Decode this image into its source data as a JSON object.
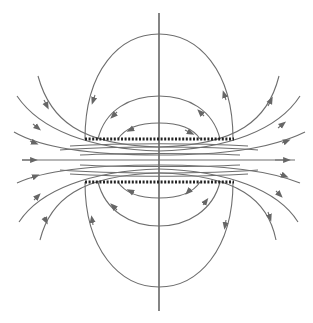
{
  "diagram": {
    "type": "magnetic field lines between two parallel current sheets",
    "colors": {
      "field_line": "#6e6e6e",
      "axis": "#333333",
      "plate": "#222222",
      "background": "#ffffff"
    },
    "elements": {
      "vertical_axis": true,
      "top_plate": "dotted horizontal conductor",
      "bottom_plate": "dotted horizontal conductor",
      "field_lines_direction": "left to right through center; loops circulate around each plate"
    }
  }
}
